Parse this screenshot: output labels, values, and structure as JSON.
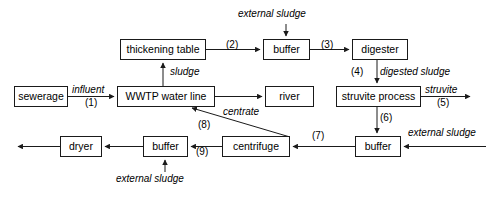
{
  "diagram": {
    "stroke_color": "#1a1a1a",
    "background_color": "#ffffff",
    "nodes": [
      {
        "id": "sewerage",
        "label": "sewerage",
        "x": 14,
        "y": 86,
        "w": 54,
        "h": 21
      },
      {
        "id": "wwtp",
        "label": "WWTP water line",
        "x": 117,
        "y": 86,
        "w": 98,
        "h": 21
      },
      {
        "id": "thickening",
        "label": "thickening table",
        "x": 120,
        "y": 39,
        "w": 86,
        "h": 21
      },
      {
        "id": "buffer_top",
        "label": "buffer",
        "x": 263,
        "y": 39,
        "w": 47,
        "h": 21
      },
      {
        "id": "digester",
        "label": "digester",
        "x": 352,
        "y": 39,
        "w": 56,
        "h": 21
      },
      {
        "id": "river",
        "label": "river",
        "x": 265,
        "y": 86,
        "w": 49,
        "h": 21
      },
      {
        "id": "struvite",
        "label": "struvite process",
        "x": 336,
        "y": 86,
        "w": 85,
        "h": 21
      },
      {
        "id": "buffer_bottom_r",
        "label": "buffer",
        "x": 355,
        "y": 136,
        "w": 46,
        "h": 21
      },
      {
        "id": "centrifuge",
        "label": "centrifuge",
        "x": 222,
        "y": 136,
        "w": 68,
        "h": 21
      },
      {
        "id": "buffer_bottom_l",
        "label": "buffer",
        "x": 143,
        "y": 136,
        "w": 45,
        "h": 21
      },
      {
        "id": "dryer",
        "label": "dryer",
        "x": 60,
        "y": 136,
        "w": 42,
        "h": 21
      }
    ],
    "labels": [
      {
        "id": "external-sludge-top",
        "text": "external sludge",
        "style": "italic",
        "x": 238,
        "y": 9,
        "w": 96
      },
      {
        "id": "flow-2",
        "text": "(2)",
        "style": "num",
        "x": 226,
        "y": 40,
        "w": 20
      },
      {
        "id": "flow-3",
        "text": "(3)",
        "style": "num",
        "x": 321,
        "y": 40,
        "w": 20
      },
      {
        "id": "sludge",
        "text": "sludge",
        "style": "italic",
        "x": 170,
        "y": 67,
        "w": 42
      },
      {
        "id": "flow-4",
        "text": "(4)",
        "style": "num",
        "x": 351,
        "y": 67,
        "w": 20
      },
      {
        "id": "digested-sludge",
        "text": "digested sludge",
        "style": "italic",
        "x": 380,
        "y": 67,
        "w": 92
      },
      {
        "id": "influent",
        "text": "influent",
        "style": "italic",
        "x": 72,
        "y": 85,
        "w": 46
      },
      {
        "id": "flow-1",
        "text": "(1)",
        "style": "num",
        "x": 85,
        "y": 98,
        "w": 20
      },
      {
        "id": "struvite-out",
        "text": "struvite",
        "style": "italic",
        "x": 425,
        "y": 85,
        "w": 46
      },
      {
        "id": "flow-5",
        "text": "(5)",
        "style": "num",
        "x": 437,
        "y": 98,
        "w": 20
      },
      {
        "id": "centrate",
        "text": "centrate",
        "style": "italic",
        "x": 223,
        "y": 107,
        "w": 48
      },
      {
        "id": "flow-8",
        "text": "(8)",
        "style": "num",
        "x": 198,
        "y": 120,
        "w": 20
      },
      {
        "id": "flow-6",
        "text": "(6)",
        "style": "num",
        "x": 380,
        "y": 113,
        "w": 20
      },
      {
        "id": "flow-7",
        "text": "(7)",
        "style": "num",
        "x": 312,
        "y": 131,
        "w": 20
      },
      {
        "id": "external-sludge-right",
        "text": "external sludge",
        "style": "italic",
        "x": 408,
        "y": 128,
        "w": 96
      },
      {
        "id": "flow-9",
        "text": "(9)",
        "style": "num",
        "x": 196,
        "y": 147,
        "w": 20
      },
      {
        "id": "external-sludge-bottom",
        "text": "external sludge",
        "style": "italic",
        "x": 116,
        "y": 174,
        "w": 96
      }
    ],
    "connections": [
      {
        "id": "sewerage-to-wwtp",
        "from": "sewerage",
        "to": "wwtp",
        "label": "influent",
        "number": "(1)"
      },
      {
        "id": "wwtp-to-thickening",
        "from": "wwtp",
        "to": "thickening",
        "label": "sludge",
        "number": ""
      },
      {
        "id": "thickening-to-buffer-top",
        "from": "thickening",
        "to": "buffer_top",
        "label": "",
        "number": "(2)"
      },
      {
        "id": "external-sludge-to-buffer-top",
        "from": "external source",
        "to": "buffer_top",
        "label": "external sludge",
        "number": ""
      },
      {
        "id": "buffer-top-to-digester",
        "from": "buffer_top",
        "to": "digester",
        "label": "",
        "number": "(3)"
      },
      {
        "id": "digester-to-struvite",
        "from": "digester",
        "to": "struvite",
        "label": "digested sludge",
        "number": "(4)"
      },
      {
        "id": "wwtp-to-river",
        "from": "wwtp",
        "to": "river",
        "label": "",
        "number": ""
      },
      {
        "id": "struvite-output",
        "from": "struvite",
        "to": "external output",
        "label": "struvite",
        "number": "(5)"
      },
      {
        "id": "struvite-to-buffer-bottom",
        "from": "struvite",
        "to": "buffer_bottom_r",
        "label": "",
        "number": "(6)"
      },
      {
        "id": "external-sludge-to-buffer-r",
        "from": "external source",
        "to": "buffer_bottom_r",
        "label": "external sludge",
        "number": ""
      },
      {
        "id": "buffer-r-to-centrifuge",
        "from": "buffer_bottom_r",
        "to": "centrifuge",
        "label": "",
        "number": "(7)"
      },
      {
        "id": "centrifuge-to-wwtp",
        "from": "centrifuge",
        "to": "wwtp",
        "label": "centrate",
        "number": "(8)"
      },
      {
        "id": "centrifuge-to-buffer-l",
        "from": "centrifuge",
        "to": "buffer_bottom_l",
        "label": "",
        "number": "(9)"
      },
      {
        "id": "external-sludge-to-buffer-l",
        "from": "external source",
        "to": "buffer_bottom_l",
        "label": "external sludge",
        "number": ""
      },
      {
        "id": "buffer-l-to-dryer",
        "from": "buffer_bottom_l",
        "to": "dryer",
        "label": "",
        "number": ""
      },
      {
        "id": "dryer-output",
        "from": "dryer",
        "to": "external output",
        "label": "",
        "number": ""
      }
    ]
  }
}
